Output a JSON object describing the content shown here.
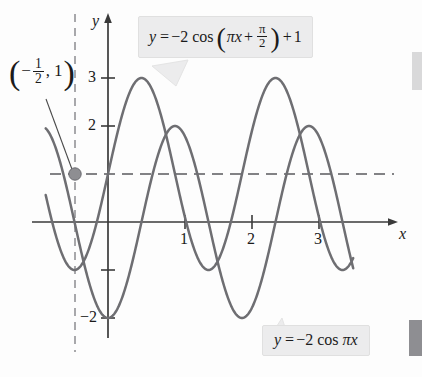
{
  "figure": {
    "background_color": "#fdfdfd",
    "curve_color": "#6e6e72",
    "axis_color": "#3a3a3a",
    "dash_color": "#5a5a5e",
    "point_color": "#8e8e92"
  },
  "callouts": {
    "upper": {
      "y": "y",
      "equals": "=",
      "coef": "−2",
      "cos": "cos",
      "open_paren": "(",
      "pi_x": "πx",
      "plus_inner": "+",
      "frac_num": "π",
      "frac_den": "2",
      "close_paren": ")",
      "plus_outer": "+",
      "constant": "1",
      "full_text": "y = −2 cos (πx + π/2) + 1"
    },
    "lower": {
      "y": "y",
      "equals": "=",
      "coef": "−2",
      "cos": "cos",
      "pi_x": "πx",
      "full_text": "y = −2 cos πx"
    }
  },
  "point_label": {
    "open_paren": "(",
    "minus": "−",
    "frac_num": "1",
    "frac_den": "2",
    "comma": ",",
    "y_value": "1",
    "close_paren": ")",
    "full_text": "(−1/2, 1)"
  },
  "axes": {
    "y_label": "y",
    "x_label": "x",
    "y_ticks": [
      {
        "value": 3,
        "label": "3"
      },
      {
        "value": 2,
        "label": "2"
      },
      {
        "value": -1,
        "label": ""
      },
      {
        "value": -2,
        "label": "−2"
      }
    ],
    "x_ticks": [
      {
        "value": 1,
        "label": "1"
      },
      {
        "value": 2,
        "label": "2"
      },
      {
        "value": 3,
        "label": "3"
      }
    ]
  },
  "chart_data": {
    "type": "line",
    "title": "",
    "xlabel": "x",
    "ylabel": "y",
    "xlim": [
      -0.95,
      3.7
    ],
    "ylim": [
      -2.4,
      3.4
    ],
    "grid": false,
    "legend": "callout-labels",
    "series": [
      {
        "name": "y = −2 cos (πx + π/2) + 1",
        "expression": "2*sin(pi*x) + 1",
        "amplitude": 2,
        "period": 2,
        "phase_shift": -0.5,
        "vertical_shift": 1,
        "y_range": [
          -1,
          3
        ],
        "maxima_x": [
          0.5,
          2.5
        ],
        "minima_x": [
          -0.5,
          1.5,
          3.5
        ],
        "color": "#6e6e72"
      },
      {
        "name": "y = −2 cos πx",
        "expression": "-2*cos(pi*x)",
        "amplitude": 2,
        "period": 2,
        "phase_shift": 0,
        "vertical_shift": 0,
        "y_range": [
          -2,
          2
        ],
        "maxima_x": [
          -1,
          1,
          3
        ],
        "minima_x": [
          0,
          2
        ],
        "color": "#6e6e72"
      }
    ],
    "marked_points": [
      {
        "x": -0.5,
        "y": 1,
        "label": "(−1/2, 1)"
      }
    ],
    "reference_lines": [
      {
        "type": "horizontal",
        "value": 1,
        "style": "dashed"
      },
      {
        "type": "vertical",
        "value": -0.5,
        "style": "dashed"
      }
    ]
  }
}
